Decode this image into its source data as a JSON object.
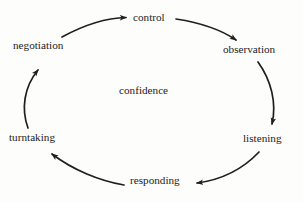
{
  "figure": {
    "top_cut_text": "—— —— ——— ————",
    "center_label": "confidence",
    "background_color": "#fdfdfc",
    "ink_color": "#1c1c1c"
  },
  "diagram": {
    "type": "cycle",
    "direction": "clockwise",
    "node_count": 6,
    "nodes": [
      {
        "id": "negotiation",
        "label": "negotiation",
        "position": "upper-left"
      },
      {
        "id": "control",
        "label": "control",
        "position": "top"
      },
      {
        "id": "observation",
        "label": "observation",
        "position": "upper-right"
      },
      {
        "id": "listening",
        "label": "listening",
        "position": "lower-right"
      },
      {
        "id": "responding",
        "label": "responding",
        "position": "bottom"
      },
      {
        "id": "turntaking",
        "label": "turntaking",
        "position": "lower-left"
      }
    ],
    "edges": [
      {
        "from": "negotiation",
        "to": "control",
        "arrowhead": "to"
      },
      {
        "from": "control",
        "to": "observation",
        "arrowhead": "to"
      },
      {
        "from": "observation",
        "to": "listening",
        "arrowhead": "to"
      },
      {
        "from": "listening",
        "to": "responding",
        "arrowhead": "to"
      },
      {
        "from": "responding",
        "to": "turntaking",
        "arrowhead": "to"
      },
      {
        "from": "turntaking",
        "to": "negotiation",
        "arrowhead": "to"
      }
    ]
  }
}
